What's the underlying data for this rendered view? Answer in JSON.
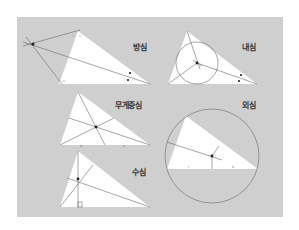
{
  "panel": {
    "background": "#cfcfcf",
    "triangle_fill": "#ffffff",
    "line_color": "#6a6a6a",
    "point_color": "#222222"
  },
  "labels": {
    "excenter": "방심",
    "incenter": "내심",
    "centroid": "무게중심",
    "circumcenter": "외심",
    "orthocenter": "수심"
  }
}
